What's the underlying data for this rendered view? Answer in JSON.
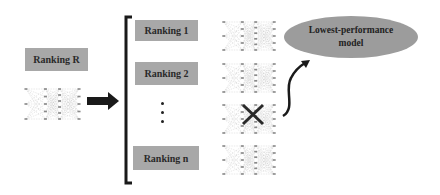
{
  "diagram": {
    "source": {
      "label": "Ranking R"
    },
    "rankings": [
      {
        "label": "Ranking 1"
      },
      {
        "label": "Ranking 2"
      },
      {
        "label": "Ranking n"
      }
    ],
    "ellipsis": "⋮",
    "result": {
      "label_line1": "Lowest-performance",
      "label_line2": "model"
    },
    "eliminated_model_index": 2,
    "icons": {
      "arrow": "right-arrow-icon",
      "bracket": "left-bracket-icon",
      "cross": "cross-icon",
      "curved_arrow": "curved-arrow-icon",
      "network": "neural-network-icon"
    }
  }
}
